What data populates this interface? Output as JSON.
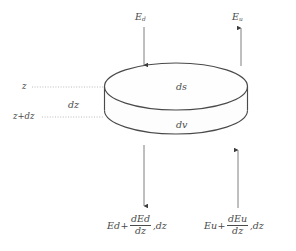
{
  "figure": {
    "type": "diagram",
    "background_color": "#ffffff",
    "stroke_color": "#4a4a4a",
    "text_color": "#4a4a4a",
    "arrow_color": "#6b6b6b"
  },
  "labels": {
    "top_left_flux": {
      "base": "E",
      "sub": "d"
    },
    "top_right_flux": {
      "base": "E",
      "sub": "u"
    },
    "surface_element": "ds",
    "volume_element": "dv",
    "depth_top": "z",
    "thickness": "dz",
    "depth_bottom": "z+dz"
  },
  "expressions": {
    "bottom_left": {
      "lead_base": "E",
      "lead_sub": "d",
      "operator": "+",
      "numerator_base": "dE",
      "numerator_sub": "d",
      "denominator": "dz",
      "tail": ",dz"
    },
    "bottom_right": {
      "lead_base": "E",
      "lead_sub": "u",
      "operator": "+",
      "numerator_base": "dE",
      "numerator_sub": "u",
      "denominator": "dz",
      "tail": ",dz"
    }
  },
  "arrows": {
    "top_left": {
      "name": "downward-incident-flux-arrow",
      "direction": "down"
    },
    "top_right": {
      "name": "upward-emergent-flux-arrow",
      "direction": "up"
    },
    "bottom_left": {
      "name": "downward-exit-flux-arrow",
      "direction": "down"
    },
    "bottom_right": {
      "name": "upward-incident-flux-arrow",
      "direction": "up"
    }
  },
  "leader_lines": {
    "top": {
      "name": "depth-z-leader",
      "style": "dotted"
    },
    "bottom": {
      "name": "depth-z-plus-dz-leader",
      "style": "dotted"
    }
  }
}
